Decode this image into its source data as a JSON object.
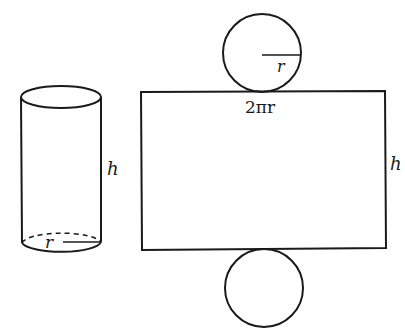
{
  "diagram": {
    "colors": {
      "stroke": "#1a1a1a",
      "background": "#ffffff"
    },
    "cylinder": {
      "height_label": "h",
      "radius_label": "r"
    },
    "net": {
      "top_circle": {
        "radius_label": "r"
      },
      "rectangle": {
        "width_label": "2πr",
        "height_label": "h"
      },
      "bottom_circle": {}
    }
  }
}
